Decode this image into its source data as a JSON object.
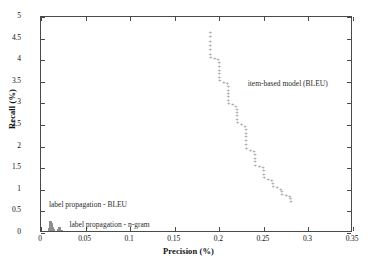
{
  "chart_data": {
    "type": "scatter",
    "title": "",
    "xlabel": "Precision (%)",
    "ylabel": "Recall (%)",
    "xlim": [
      0,
      0.35
    ],
    "ylim": [
      0,
      5
    ],
    "grid": false,
    "legend_position": "inline-annotations",
    "xticks": [
      "0",
      "0.05",
      "0.1",
      "0.15",
      "0.2",
      "0.25",
      "0.3",
      "0.35"
    ],
    "xtick_values": [
      0,
      0.05,
      0.1,
      0.15,
      0.2,
      0.25,
      0.3,
      0.35
    ],
    "yticks": [
      "0",
      "0.5",
      "1",
      "1.5",
      "2",
      "2.5",
      "3",
      "3.5",
      "4",
      "4.5",
      "5"
    ],
    "ytick_values": [
      0,
      0.5,
      1,
      1.5,
      2,
      2.5,
      3,
      3.5,
      4,
      4.5,
      5
    ],
    "marker_color": "#8e8e8e",
    "frame_color": "#4a4a4a",
    "series": [
      {
        "name": "item-based model (BLEU)",
        "marker": "+",
        "points": [
          [
            0.19,
            4.65
          ],
          [
            0.19,
            4.55
          ],
          [
            0.19,
            4.45
          ],
          [
            0.19,
            4.35
          ],
          [
            0.19,
            4.25
          ],
          [
            0.19,
            4.15
          ],
          [
            0.1905,
            4.08
          ],
          [
            0.195,
            4.05
          ],
          [
            0.1985,
            4.02
          ],
          [
            0.2,
            3.95
          ],
          [
            0.2,
            3.86
          ],
          [
            0.2,
            3.78
          ],
          [
            0.2,
            3.7
          ],
          [
            0.2,
            3.62
          ],
          [
            0.2005,
            3.54
          ],
          [
            0.205,
            3.5
          ],
          [
            0.209,
            3.48
          ],
          [
            0.21,
            3.4
          ],
          [
            0.21,
            3.32
          ],
          [
            0.21,
            3.24
          ],
          [
            0.21,
            3.16
          ],
          [
            0.21,
            3.08
          ],
          [
            0.2105,
            3.0
          ],
          [
            0.215,
            2.98
          ],
          [
            0.2185,
            2.95
          ],
          [
            0.22,
            2.88
          ],
          [
            0.22,
            2.8
          ],
          [
            0.22,
            2.72
          ],
          [
            0.22,
            2.64
          ],
          [
            0.2205,
            2.56
          ],
          [
            0.225,
            2.52
          ],
          [
            0.229,
            2.48
          ],
          [
            0.23,
            2.4
          ],
          [
            0.23,
            2.32
          ],
          [
            0.23,
            2.24
          ],
          [
            0.23,
            2.16
          ],
          [
            0.23,
            2.06
          ],
          [
            0.2305,
            1.96
          ],
          [
            0.235,
            1.92
          ],
          [
            0.239,
            1.89
          ],
          [
            0.24,
            1.82
          ],
          [
            0.24,
            1.74
          ],
          [
            0.24,
            1.66
          ],
          [
            0.2405,
            1.58
          ],
          [
            0.245,
            1.55
          ],
          [
            0.249,
            1.52
          ],
          [
            0.25,
            1.45
          ],
          [
            0.25,
            1.37
          ],
          [
            0.2505,
            1.29
          ],
          [
            0.255,
            1.26
          ],
          [
            0.259,
            1.23
          ],
          [
            0.26,
            1.16
          ],
          [
            0.2605,
            1.09
          ],
          [
            0.265,
            1.06
          ],
          [
            0.269,
            1.03
          ],
          [
            0.27,
            0.97
          ],
          [
            0.2705,
            0.91
          ],
          [
            0.275,
            0.88
          ],
          [
            0.279,
            0.85
          ],
          [
            0.28,
            0.8
          ],
          [
            0.2805,
            0.75
          ]
        ]
      },
      {
        "name": "label propagation - BLEU",
        "marker": "bar-cluster",
        "points": [
          [
            0.008,
            0.05
          ],
          [
            0.0095,
            0.12
          ],
          [
            0.0105,
            0.27
          ],
          [
            0.0115,
            0.22
          ],
          [
            0.0125,
            0.14
          ],
          [
            0.0135,
            0.09
          ],
          [
            0.0145,
            0.05
          ],
          [
            0.0155,
            0.03
          ]
        ]
      },
      {
        "name": "label propagation - n-gram",
        "marker": "bar-cluster",
        "points": [
          [
            0.0195,
            0.1
          ],
          [
            0.021,
            0.13
          ],
          [
            0.0225,
            0.07
          ],
          [
            0.024,
            0.03
          ]
        ]
      }
    ],
    "annotations": [
      {
        "text": "item-based model (BLEU)",
        "x": 0.233,
        "y": 3.43
      },
      {
        "text": "label propagation - BLEU",
        "x": 0.01,
        "y": 0.62
      },
      {
        "text": "label propagation - n-gram",
        "x": 0.033,
        "y": 0.17
      }
    ]
  }
}
